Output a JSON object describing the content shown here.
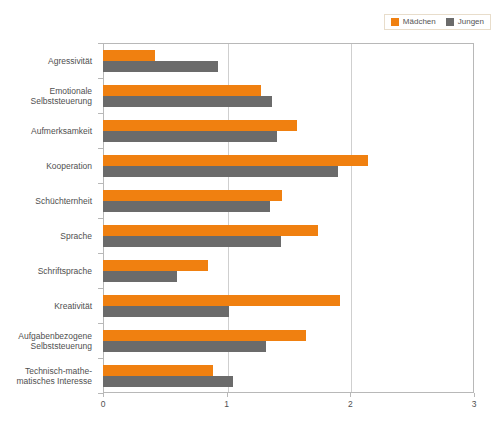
{
  "chart_data": {
    "type": "bar",
    "orientation": "horizontal",
    "title": "",
    "xlabel": "",
    "ylabel": "",
    "xlim": [
      0,
      3
    ],
    "xticks": [
      0,
      1,
      2,
      3
    ],
    "xtick_labels": [
      "0",
      "1",
      "2",
      "3"
    ],
    "grid": true,
    "grid_axis": "x",
    "legend_position": "top-right",
    "categories": [
      "Agressivität",
      "Emotionale Selbststeuerung",
      "Aufmerksamkeit",
      "Kooperation",
      "Schüchternheit",
      "Sprache",
      "Schriftsprache",
      "Kreativität",
      "Aufgabenbezogene Selbststeuerung",
      "Technisch-mathematisches Interesse"
    ],
    "category_lines": [
      [
        "Agressivität"
      ],
      [
        "Emotionale",
        "Selbststeuerung"
      ],
      [
        "Aufmerksamkeit"
      ],
      [
        "Kooperation"
      ],
      [
        "Schüchternheit"
      ],
      [
        "Sprache"
      ],
      [
        "Schriftsprache"
      ],
      [
        "Kreativität"
      ],
      [
        "Aufgabenbezogene",
        "Selbststeuerung"
      ],
      [
        "Technisch-mathe-",
        "matisches Interesse"
      ]
    ],
    "series": [
      {
        "name": "Mädchen",
        "color": "#F08010",
        "values": [
          0.42,
          1.28,
          1.57,
          2.14,
          1.45,
          1.74,
          0.85,
          1.92,
          1.64,
          0.89
        ]
      },
      {
        "name": "Jungen",
        "color": "#6B6B6B",
        "values": [
          0.93,
          1.37,
          1.41,
          1.9,
          1.35,
          1.44,
          0.6,
          1.02,
          1.32,
          1.05
        ]
      }
    ]
  },
  "legend": {
    "entries": [
      {
        "label": "Mädchen",
        "color": "#F08010"
      },
      {
        "label": "Jungen",
        "color": "#6B6B6B"
      }
    ]
  },
  "caption": {
    "text": ""
  }
}
